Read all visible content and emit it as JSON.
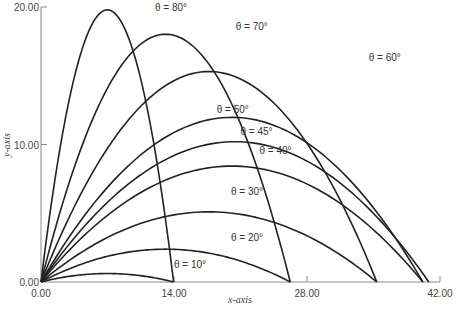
{
  "chart_data": {
    "type": "line",
    "title": "",
    "xlabel": "x-axis",
    "ylabel": "y-axis",
    "xlim": [
      0,
      42
    ],
    "ylim": [
      0,
      20
    ],
    "grid": false,
    "legend": "inline labels",
    "x_ticks": [
      "0.00",
      "14.00",
      "28.00",
      "42.00"
    ],
    "y_ticks": [
      "0.00",
      "10.00",
      "20.00"
    ],
    "model": {
      "v0": 20,
      "g": 9.8,
      "description": "projectile trajectories y = x·tanθ − g·x²/(2·v0²·cos²θ)"
    },
    "series": [
      {
        "name": "θ = 10°",
        "angle": 10,
        "range": 13.96,
        "max_height": 0.62
      },
      {
        "name": "θ = 20°",
        "angle": 20,
        "range": 26.23,
        "max_height": 2.39
      },
      {
        "name": "θ = 30°",
        "angle": 30,
        "range": 35.35,
        "max_height": 5.1
      },
      {
        "name": "θ = 40°",
        "angle": 40,
        "range": 40.19,
        "max_height": 8.43
      },
      {
        "name": "θ = 45°",
        "angle": 45,
        "range": 40.82,
        "max_height": 10.2
      },
      {
        "name": "θ = 50°",
        "angle": 50,
        "range": 40.19,
        "max_height": 11.97
      },
      {
        "name": "θ = 60°",
        "angle": 60,
        "range": 35.35,
        "max_height": 15.31
      },
      {
        "name": "θ = 70°",
        "angle": 70,
        "range": 26.23,
        "max_height": 18.01
      },
      {
        "name": "θ = 80°",
        "angle": 80,
        "range": 13.96,
        "max_height": 19.79
      }
    ],
    "labels": [
      {
        "text": "θ = 10°",
        "x": 14.0,
        "y": 1.0,
        "angle": 10
      },
      {
        "text": "θ = 20°",
        "x": 20.0,
        "y": 3.0,
        "angle": 20
      },
      {
        "text": "θ = 30°",
        "x": 20.0,
        "y": 6.3,
        "angle": 30
      },
      {
        "text": "θ = 40°",
        "x": 23.0,
        "y": 9.3,
        "angle": 40
      },
      {
        "text": "θ = 45°",
        "x": 21.0,
        "y": 10.7,
        "angle": 45
      },
      {
        "text": "θ = 50°",
        "x": 18.5,
        "y": 12.3,
        "angle": 50
      },
      {
        "text": "θ = 60°",
        "x": 34.5,
        "y": 16.1,
        "angle": 60
      },
      {
        "text": "θ = 70°",
        "x": 20.5,
        "y": 18.3,
        "angle": 70
      },
      {
        "text": "θ = 80°",
        "x": 12.0,
        "y": 19.7,
        "angle": 80
      }
    ]
  },
  "plot": {
    "x_axis_title": "x-axis",
    "y_axis_title": "y-axis",
    "colors": {
      "curve": "#222222",
      "axis": "#888888",
      "text": "#444444"
    }
  }
}
